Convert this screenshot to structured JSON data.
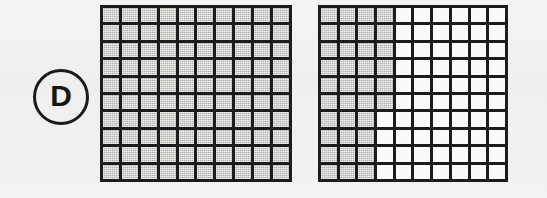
{
  "figure": {
    "label": "D",
    "label_icon": "circled-letter-badge",
    "background_color": "#f3f1ef",
    "line_color": "#1c1c1c",
    "shaded_color": "#b3b1ae",
    "empty_color": "#fbfafa"
  },
  "chart_data": {
    "type": "heatmap",
    "title": "D",
    "subtitle": "",
    "xlabel": "",
    "ylabel": "",
    "grid": true,
    "legend_position": "none",
    "categories": [
      "column-1",
      "column-2",
      "column-3",
      "column-4",
      "column-5",
      "column-6",
      "column-7",
      "column-8",
      "column-9",
      "column-10"
    ],
    "series": [
      {
        "name": "left-grid",
        "rows": 10,
        "cols": 10,
        "shaded_count": 100,
        "total_count": 100,
        "fraction": "100/100",
        "values": [
          [
            1,
            1,
            1,
            1,
            1,
            1,
            1,
            1,
            1,
            1
          ],
          [
            1,
            1,
            1,
            1,
            1,
            1,
            1,
            1,
            1,
            1
          ],
          [
            1,
            1,
            1,
            1,
            1,
            1,
            1,
            1,
            1,
            1
          ],
          [
            1,
            1,
            1,
            1,
            1,
            1,
            1,
            1,
            1,
            1
          ],
          [
            1,
            1,
            1,
            1,
            1,
            1,
            1,
            1,
            1,
            1
          ],
          [
            1,
            1,
            1,
            1,
            1,
            1,
            1,
            1,
            1,
            1
          ],
          [
            1,
            1,
            1,
            1,
            1,
            1,
            1,
            1,
            1,
            1
          ],
          [
            1,
            1,
            1,
            1,
            1,
            1,
            1,
            1,
            1,
            1
          ],
          [
            1,
            1,
            1,
            1,
            1,
            1,
            1,
            1,
            1,
            1
          ],
          [
            1,
            1,
            1,
            1,
            1,
            1,
            1,
            1,
            1,
            1
          ]
        ]
      },
      {
        "name": "right-grid",
        "rows": 10,
        "cols": 10,
        "shaded_count": 36,
        "total_count": 100,
        "fraction": "36/100",
        "values": [
          [
            1,
            1,
            1,
            1,
            0,
            0,
            0,
            0,
            0,
            0
          ],
          [
            1,
            1,
            1,
            1,
            0,
            0,
            0,
            0,
            0,
            0
          ],
          [
            1,
            1,
            1,
            1,
            0,
            0,
            0,
            0,
            0,
            0
          ],
          [
            1,
            1,
            1,
            1,
            0,
            0,
            0,
            0,
            0,
            0
          ],
          [
            1,
            1,
            1,
            1,
            0,
            0,
            0,
            0,
            0,
            0
          ],
          [
            1,
            1,
            1,
            1,
            0,
            0,
            0,
            0,
            0,
            0
          ],
          [
            1,
            1,
            1,
            0,
            0,
            0,
            0,
            0,
            0,
            0
          ],
          [
            1,
            1,
            1,
            0,
            0,
            0,
            0,
            0,
            0,
            0
          ],
          [
            1,
            1,
            1,
            0,
            0,
            0,
            0,
            0,
            0,
            0
          ],
          [
            1,
            1,
            1,
            0,
            0,
            0,
            0,
            0,
            0,
            0
          ]
        ]
      }
    ]
  }
}
